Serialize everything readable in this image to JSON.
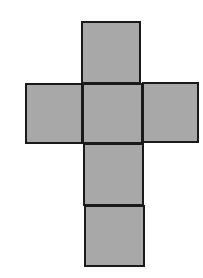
{
  "diagram": {
    "type": "cube-net",
    "fill_color": "#a8a8a8",
    "stroke_color": "#1a1a1a",
    "faces": [
      {
        "id": "top",
        "x": 81,
        "y": 21,
        "w": 60,
        "h": 63
      },
      {
        "id": "left",
        "x": 25,
        "y": 83,
        "w": 58,
        "h": 61
      },
      {
        "id": "center",
        "x": 82,
        "y": 83,
        "w": 61,
        "h": 61
      },
      {
        "id": "right",
        "x": 142,
        "y": 82,
        "w": 57,
        "h": 61
      },
      {
        "id": "lower",
        "x": 83,
        "y": 143,
        "w": 61,
        "h": 63
      },
      {
        "id": "bottom",
        "x": 84,
        "y": 205,
        "w": 61,
        "h": 62
      }
    ]
  }
}
